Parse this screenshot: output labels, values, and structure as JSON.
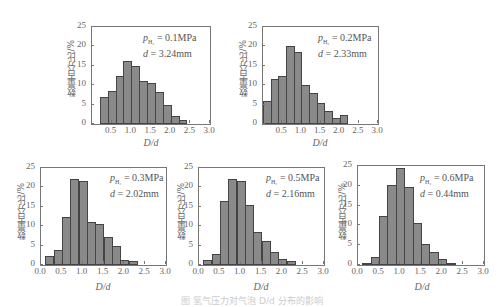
{
  "chart_data": [
    {
      "type": "bar",
      "title": "",
      "annotation": {
        "pressure_label": "p",
        "pressure_sub": "H2",
        "pressure_value": "= 0.1MPa",
        "d_label": "d",
        "d_value": "= 3.24mm"
      },
      "xlabel": "D/d",
      "ylabel": "数量百分比/%",
      "x_ticks": [
        "0.5",
        "1.0",
        "1.5",
        "2.0",
        "2.5",
        "3.0"
      ],
      "y_ticks": [
        "0",
        "5",
        "10",
        "15",
        "20",
        "25"
      ],
      "xlim": [
        0.0,
        3.0
      ],
      "ylim": [
        0,
        25
      ],
      "bin_width": 0.2,
      "bin_starts": [
        0.2,
        0.4,
        0.6,
        0.8,
        1.0,
        1.2,
        1.4,
        1.6,
        1.8,
        2.0,
        2.2
      ],
      "values": [
        7.0,
        8.6,
        12.4,
        16.2,
        15.0,
        11.0,
        10.6,
        8.2,
        5.0,
        2.0,
        1.0
      ]
    },
    {
      "type": "bar",
      "title": "",
      "annotation": {
        "pressure_label": "p",
        "pressure_sub": "H2",
        "pressure_value": "= 0.2MPa",
        "d_label": "d",
        "d_value": "= 2.33mm"
      },
      "xlabel": "D/d",
      "ylabel": "数量百分比/%",
      "x_ticks": [
        "0.5",
        "1.0",
        "1.5",
        "2.0",
        "2.5",
        "3.0"
      ],
      "y_ticks": [
        "0",
        "5",
        "10",
        "15",
        "20",
        "25"
      ],
      "xlim": [
        0.0,
        3.0
      ],
      "ylim": [
        0,
        25
      ],
      "bin_width": 0.2,
      "bin_starts": [
        0.0,
        0.2,
        0.4,
        0.6,
        0.8,
        1.0,
        1.2,
        1.4,
        1.6,
        1.8,
        2.0
      ],
      "values": [
        6.0,
        11.6,
        12.4,
        20.2,
        18.6,
        10.0,
        8.0,
        5.4,
        3.4,
        1.6,
        2.2
      ]
    },
    {
      "type": "bar",
      "title": "",
      "annotation": {
        "pressure_label": "p",
        "pressure_sub": "H2",
        "pressure_value": "= 0.3MPa",
        "d_label": "d",
        "d_value": "= 2.02mm"
      },
      "xlabel": "D/d",
      "ylabel": "数量百分比/%",
      "x_ticks": [
        "0.0",
        "0.5",
        "1.0",
        "1.5",
        "2.0",
        "2.5",
        "3.0"
      ],
      "y_ticks": [
        "0",
        "5",
        "10",
        "15",
        "20",
        "25"
      ],
      "xlim": [
        0.0,
        3.0
      ],
      "ylim": [
        0,
        25
      ],
      "bin_width": 0.2,
      "bin_starts": [
        0.1,
        0.3,
        0.5,
        0.7,
        0.9,
        1.1,
        1.3,
        1.5,
        1.7,
        1.9,
        2.1
      ],
      "values": [
        2.2,
        3.8,
        12.4,
        22.2,
        21.6,
        11.0,
        10.6,
        7.2,
        5.0,
        1.2,
        1.0
      ]
    },
    {
      "type": "bar",
      "title": "",
      "annotation": {
        "pressure_label": "p",
        "pressure_sub": "H2",
        "pressure_value": "= 0.5MPa",
        "d_label": "d",
        "d_value": "= 2.16mm"
      },
      "xlabel": "D/d",
      "ylabel": "数量百分比/%",
      "x_ticks": [
        "0.0",
        "0.5",
        "1.0",
        "1.5",
        "2.0",
        "2.5",
        "3.0"
      ],
      "y_ticks": [
        "0",
        "5",
        "10",
        "15",
        "20",
        "25"
      ],
      "xlim": [
        0.0,
        3.0
      ],
      "ylim": [
        0,
        25
      ],
      "bin_width": 0.2,
      "bin_starts": [
        0.1,
        0.3,
        0.5,
        0.7,
        0.9,
        1.1,
        1.3,
        1.5,
        1.7,
        1.9,
        2.1
      ],
      "values": [
        1.2,
        2.8,
        16.4,
        22.2,
        21.6,
        15.4,
        8.6,
        6.2,
        3.4,
        1.6,
        1.0
      ]
    },
    {
      "type": "bar",
      "title": "",
      "annotation": {
        "pressure_label": "p",
        "pressure_sub": "H2",
        "pressure_value": "= 0.6MPa",
        "d_label": "d",
        "d_value": "= 0.44mm"
      },
      "xlabel": "D/d",
      "ylabel": "数量百分比/%",
      "x_ticks": [
        "0.0",
        "0.5",
        "1.0",
        "1.5",
        "2.0",
        "2.5",
        "3.0"
      ],
      "y_ticks": [
        "0",
        "5",
        "10",
        "15",
        "20",
        "25"
      ],
      "xlim": [
        0.0,
        3.0
      ],
      "ylim": [
        0,
        25
      ],
      "bin_width": 0.2,
      "bin_starts": [
        0.1,
        0.3,
        0.5,
        0.7,
        0.9,
        1.1,
        1.3,
        1.5,
        1.7,
        1.9,
        2.1
      ],
      "values": [
        0.2,
        2.0,
        12.4,
        20.2,
        24.6,
        19.6,
        10.6,
        5.2,
        3.4,
        1.6,
        0.4
      ]
    }
  ],
  "panels": [
    {
      "annot_p": "p",
      "annot_sub": "H₂",
      "annot_pval": " = 0.1MPa",
      "annot_d": "d",
      "annot_dval": " = 3.24mm",
      "xlabel": "D/d",
      "ylabel": "数量百分比/%"
    },
    {
      "annot_p": "p",
      "annot_sub": "H₂",
      "annot_pval": " = 0.2MPa",
      "annot_d": "d",
      "annot_dval": " = 2.33mm",
      "xlabel": "D/d",
      "ylabel": "数量百分比/%"
    },
    {
      "annot_p": "p",
      "annot_sub": "H₂",
      "annot_pval": " = 0.3MPa",
      "annot_d": "d",
      "annot_dval": " = 2.02mm",
      "xlabel": "D/d",
      "ylabel": "数量百分比/%"
    },
    {
      "annot_p": "p",
      "annot_sub": "H₂",
      "annot_pval": " = 0.5MPa",
      "annot_d": "d",
      "annot_dval": " = 2.16mm",
      "xlabel": "D/d",
      "ylabel": "数量百分比/%"
    },
    {
      "annot_p": "p",
      "annot_sub": "H₂",
      "annot_pval": " = 0.6MPa",
      "annot_d": "d",
      "annot_dval": " = 0.44mm",
      "xlabel": "D/d",
      "ylabel": "数量百分比/%"
    }
  ],
  "caption": "图 氢气压力对气泡 D/d 分布的影响",
  "colors": {
    "bar_fill": "#8a8a8a",
    "bar_edge": "#444444",
    "axis": "#777777",
    "text": "#666666"
  }
}
